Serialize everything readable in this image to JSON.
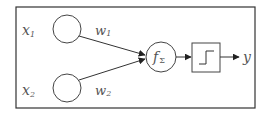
{
  "diagram": {
    "title": "",
    "inputs": [
      {
        "label": "x",
        "sub": "1",
        "weight": "w",
        "weight_sub": "1"
      },
      {
        "label": "x",
        "sub": "2",
        "weight": "w",
        "weight_sub": "2"
      }
    ],
    "sum_node": {
      "label": "f",
      "sub": "Σ"
    },
    "activation": {
      "type": "step-function-icon"
    },
    "output": {
      "label": "y"
    },
    "colors": {
      "stroke": "#333333",
      "text": "#555555",
      "background": "#ffffff"
    }
  }
}
